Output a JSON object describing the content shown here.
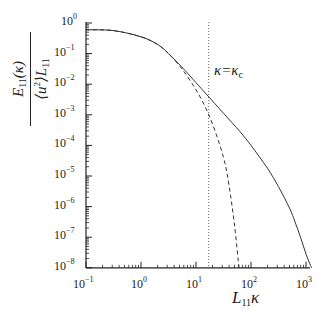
{
  "chart_data": {
    "type": "line",
    "title": "",
    "xlabel": "L11 κ",
    "ylabel": "E11(κ) / (⟨u²⟩ L11)",
    "xscale": "log",
    "yscale": "log",
    "xlim": [
      0.1,
      1000
    ],
    "ylim": [
      1e-08,
      1
    ],
    "grid": false,
    "legend": null,
    "x_ticks": [
      "10^-1",
      "10^0",
      "10^1",
      "10^2",
      "10^3"
    ],
    "y_ticks": [
      "10^-8",
      "10^-7",
      "10^-6",
      "10^-5",
      "10^-4",
      "10^-3",
      "10^-2",
      "10^-1",
      "10^0"
    ],
    "annotations": [
      {
        "text": "κ=κc",
        "type": "vertical-dotted-line",
        "x": 17
      }
    ],
    "series": [
      {
        "name": "full spectrum",
        "style": "solid",
        "log10_x": [
          -1,
          -0.5,
          0,
          0.3,
          0.5,
          0.8,
          1.0,
          1.2,
          1.5,
          1.8,
          2.0,
          2.3,
          2.5,
          2.7,
          2.8,
          2.9,
          3.0,
          3.1
        ],
        "log10_y": [
          -0.22,
          -0.25,
          -0.45,
          -0.7,
          -1.0,
          -1.55,
          -1.95,
          -2.35,
          -2.95,
          -3.55,
          -4.0,
          -4.75,
          -5.35,
          -6.05,
          -6.5,
          -7.0,
          -7.55,
          -8.0
        ]
      },
      {
        "name": "truncated spectrum",
        "style": "dashed",
        "log10_x": [
          -1,
          -0.5,
          0,
          0.3,
          0.5,
          0.7,
          0.9,
          1.1,
          1.3,
          1.5,
          1.6,
          1.7,
          1.78
        ],
        "log10_y": [
          -0.22,
          -0.25,
          -0.45,
          -0.7,
          -1.0,
          -1.4,
          -1.9,
          -2.5,
          -3.3,
          -4.4,
          -5.3,
          -6.6,
          -8.0
        ]
      }
    ]
  },
  "axes": {
    "x_label_main": "L",
    "x_label_sub": "11",
    "x_label_var": "κ",
    "y_num_main": "E",
    "y_num_sub": "11",
    "y_num_arg": "(κ)",
    "y_den_open": "⟨u",
    "y_den_sup": "2",
    "y_den_close": "⟩L",
    "y_den_sub": "11",
    "annotation_lhs": "κ=κ",
    "annotation_sub": "c",
    "x_tick_base": "10",
    "y_tick_base": "10",
    "x_tick_exps": [
      "−1",
      "0",
      "1",
      "2",
      "3"
    ],
    "y_tick_exps": [
      "0",
      "−1",
      "−2",
      "−3",
      "−4",
      "−5",
      "−6",
      "−7",
      "−8"
    ]
  }
}
